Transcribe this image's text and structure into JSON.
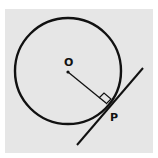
{
  "diagram": {
    "labels": {
      "center": "O",
      "point": "P"
    },
    "colors": {
      "background": "#e6e6e6",
      "stroke": "#111111"
    },
    "shapes": {
      "circle": {
        "cx": 68,
        "cy": 71,
        "r": 53
      },
      "radius": {
        "x1": 68,
        "y1": 72,
        "x2": 107,
        "y2": 104
      },
      "tangent": {
        "x1": 77,
        "y1": 145,
        "x2": 143,
        "y2": 68
      },
      "right_angle_marker": true
    }
  }
}
